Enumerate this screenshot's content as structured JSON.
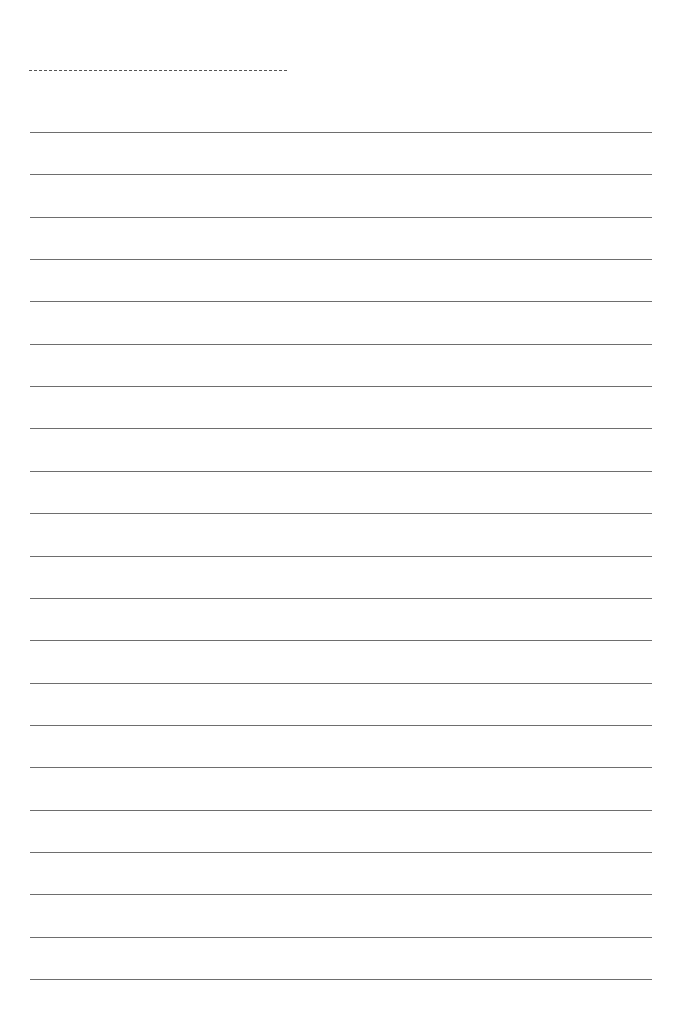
{
  "page": {
    "type": "lined-writing-paper",
    "background_color": "#ffffff",
    "line_color": "#6e6e6e"
  },
  "header": {
    "name_line": {
      "style": "dashed",
      "left": 29,
      "top": 70,
      "width": 258
    }
  },
  "lines": {
    "count": 21,
    "first_top": 132,
    "spacing": 42.35,
    "left": 30,
    "width": 622
  }
}
